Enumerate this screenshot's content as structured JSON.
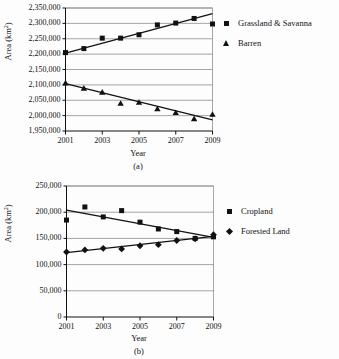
{
  "figure": {
    "background_color": "#fdfdfd",
    "axis_color": "#111111",
    "gridline_color": "#808080",
    "marker_color": "#111111",
    "trend_line_color": "#111111"
  },
  "chart_data": [
    {
      "type": "scatter",
      "panel": "(a)",
      "title": "",
      "xlabel": "Year",
      "ylabel": "Area (km2)",
      "ylabel_display": "Area (km²)",
      "x": [
        2001,
        2002,
        2003,
        2004,
        2005,
        2006,
        2007,
        2008,
        2009
      ],
      "xlim": [
        2001,
        2009
      ],
      "ylim": [
        1950000,
        2350000
      ],
      "xticks": [
        2001,
        2003,
        2005,
        2007,
        2009
      ],
      "xticklabels": [
        "2001",
        "2003",
        "2005",
        "2007",
        "2009"
      ],
      "yticks": [
        1950000,
        2000000,
        2050000,
        2100000,
        2150000,
        2200000,
        2250000,
        2300000,
        2350000
      ],
      "yticklabels": [
        "1,950,000",
        "2,000,000",
        "2,050,000",
        "2,100,000",
        "2,150,000",
        "2,200,000",
        "2,250,000",
        "2,300,000",
        "2,350,000"
      ],
      "grid": true,
      "grid_axis": "y",
      "legend_position": "right",
      "series": [
        {
          "name": "Grassland & Savanna",
          "marker": "square",
          "values": [
            2205000,
            2218000,
            2252000,
            2252000,
            2263000,
            2295000,
            2301000,
            2316000,
            2298000
          ],
          "trend_line": {
            "start": [
              2001,
              2203000
            ],
            "end": [
              2009,
              2332000
            ]
          }
        },
        {
          "name": "Barren",
          "marker": "triangle",
          "values": [
            2105000,
            2088000,
            2075000,
            2039000,
            2042000,
            2021000,
            2009000,
            1989000,
            2003000
          ],
          "trend_line": {
            "start": [
              2001,
              2104000
            ],
            "end": [
              2009,
              1986000
            ]
          }
        }
      ]
    },
    {
      "type": "scatter",
      "panel": "(b)",
      "title": "",
      "xlabel": "Year",
      "ylabel": "Area (km2)",
      "ylabel_display": "Area (km²)",
      "x": [
        2001,
        2002,
        2003,
        2004,
        2005,
        2006,
        2007,
        2008,
        2009
      ],
      "xlim": [
        2001,
        2009
      ],
      "ylim": [
        0,
        250000
      ],
      "xticks": [
        2001,
        2003,
        2005,
        2007,
        2009
      ],
      "xticklabels": [
        "2001",
        "2003",
        "2005",
        "2007",
        "2009"
      ],
      "yticks": [
        0,
        50000,
        100000,
        150000,
        200000,
        250000
      ],
      "yticklabels": [
        "0",
        "50,000",
        "100,000",
        "150,000",
        "200,000",
        "250,000"
      ],
      "grid": true,
      "grid_axis": "y",
      "legend_position": "right",
      "series": [
        {
          "name": "Cropland",
          "marker": "square",
          "values": [
            185000,
            210000,
            191000,
            203000,
            181000,
            168000,
            163000,
            150000,
            153000
          ],
          "trend_line": {
            "start": [
              2001,
              204000
            ],
            "end": [
              2009,
              152000
            ]
          }
        },
        {
          "name": "Forested Land",
          "marker": "diamond",
          "values": [
            124000,
            128000,
            131000,
            130000,
            136000,
            138000,
            146000,
            149000,
            157000
          ],
          "trend_line": {
            "start": [
              2001,
              123000
            ],
            "end": [
              2009,
              154000
            ]
          }
        }
      ]
    }
  ]
}
